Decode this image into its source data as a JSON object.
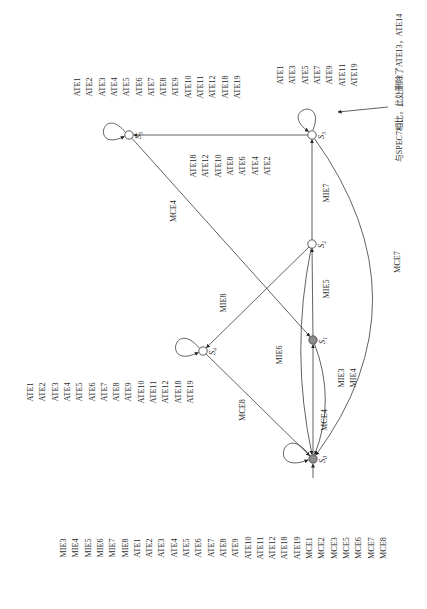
{
  "diagram": {
    "type": "state-transition-diagram",
    "orientation": "rotated 90 degrees counter-clockwise",
    "states": [
      {
        "id": "S0",
        "label": "S",
        "sub": "0",
        "style": "filled",
        "initial": true
      },
      {
        "id": "S1",
        "label": "S",
        "sub": "1",
        "style": "filled"
      },
      {
        "id": "S2",
        "label": "S",
        "sub": "2",
        "style": "open"
      },
      {
        "id": "S3",
        "label": "S",
        "sub": "3",
        "style": "open"
      },
      {
        "id": "S4",
        "label": "S",
        "sub": "4",
        "style": "open"
      },
      {
        "id": "S5",
        "label": "S",
        "sub": "5",
        "style": "open"
      }
    ],
    "self_loops": {
      "S0": [
        "MIE3",
        "MIE4",
        "MIE5",
        "MIE6",
        "MIE7",
        "MIE8",
        "ATE1",
        "ATE2",
        "ATE3",
        "ATE4",
        "ATE5",
        "ATE6",
        "ATE7",
        "ATE8",
        "ATE9",
        "ATE10",
        "ATE11",
        "ATE12",
        "ATE18",
        "ATE19",
        "MCE1",
        "MCE2",
        "MCE3",
        "MCE5",
        "MCE6",
        "MCE7",
        "MCE8"
      ],
      "S4": [
        "ATE1",
        "ATE2",
        "ATE3",
        "ATE4",
        "ATE5",
        "ATE6",
        "ATE7",
        "ATE8",
        "ATE9",
        "ATE10",
        "ATE11",
        "ATE12",
        "ATE18",
        "ATE19"
      ],
      "S5": [
        "ATE1",
        "ATE2",
        "ATE3",
        "ATE4",
        "ATE5",
        "ATE6",
        "ATE7",
        "ATE8",
        "ATE9",
        "ATE10",
        "ATE11",
        "ATE12",
        "ATE18",
        "ATE19"
      ],
      "S3": [
        "ATE1",
        "ATE3",
        "ATE5",
        "ATE7",
        "ATE9",
        "ATE11",
        "ATE19"
      ]
    },
    "transitions": [
      {
        "from": "S0",
        "to": "S1",
        "labels": [
          "MCE4"
        ]
      },
      {
        "from": "S1",
        "to": "S0",
        "labels": [
          "MIE3",
          "MIE4"
        ]
      },
      {
        "from": "S1",
        "to": "S2",
        "labels": [
          "MIE5"
        ]
      },
      {
        "from": "S2",
        "to": "S0",
        "labels": [
          "MIE6"
        ]
      },
      {
        "from": "S2",
        "to": "S3",
        "labels": [
          "MIE7"
        ]
      },
      {
        "from": "S2",
        "to": "S4",
        "labels": [
          "MIE8"
        ]
      },
      {
        "from": "S3",
        "to": "S0",
        "labels": [
          "MCE7"
        ]
      },
      {
        "from": "S3",
        "to": "S5",
        "labels": [
          "ATE18",
          "ATE12",
          "ATE10",
          "ATE8",
          "ATE6",
          "ATE4",
          "ATE2"
        ]
      },
      {
        "from": "S4",
        "to": "S0",
        "labels": [
          "MCE8"
        ]
      },
      {
        "from": "S5",
        "to": "S1",
        "labels": [
          "MCE4"
        ]
      }
    ],
    "annotation": {
      "text": "与SPEC7相比，此处删除了ATE13，ATE14",
      "points_to": "S3 self-loop"
    }
  }
}
